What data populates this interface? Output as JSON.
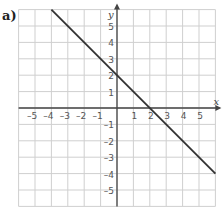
{
  "figure": {
    "label": "a)"
  },
  "chart_data": {
    "type": "line",
    "title": "",
    "xlabel": "x",
    "ylabel": "y",
    "xlim": [
      -6,
      6
    ],
    "ylim": [
      -6,
      6
    ],
    "grid": true,
    "x_ticks": [
      -5,
      -4,
      -3,
      -2,
      -1,
      1,
      2,
      3,
      4,
      5
    ],
    "y_ticks": [
      -5,
      -4,
      -3,
      -2,
      -1,
      1,
      2,
      3,
      4,
      5
    ],
    "series": [
      {
        "name": "y = -x + 2",
        "x": [
          -4,
          6
        ],
        "y": [
          6,
          -4
        ],
        "color": "#333333"
      }
    ]
  }
}
